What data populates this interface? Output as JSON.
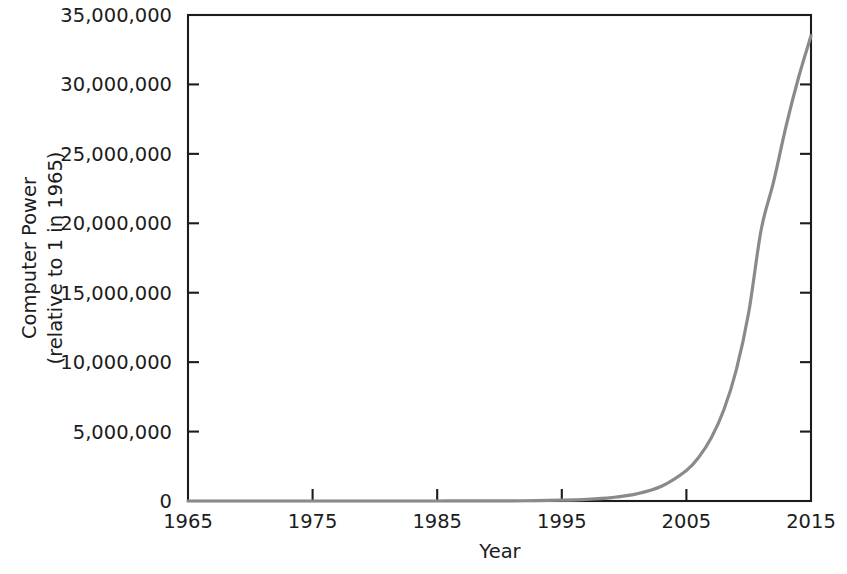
{
  "chart_data": {
    "type": "line",
    "title": "",
    "xlabel": "Year",
    "ylabel_line1": "Computer Power",
    "ylabel_line2": "(relative to 1 in 1965)",
    "xlim": [
      1965,
      2015
    ],
    "ylim": [
      0,
      35000000
    ],
    "grid": false,
    "legend": "none",
    "line_color": "#8a8a8a",
    "axis_color": "#1c1c1c",
    "background_color": "#ffffff",
    "x_ticks": [
      1965,
      1975,
      1985,
      1995,
      2005,
      2015
    ],
    "x_tick_labels": [
      "1965",
      "1975",
      "1985",
      "1995",
      "2005",
      "2015"
    ],
    "y_ticks": [
      0,
      5000000,
      10000000,
      15000000,
      20000000,
      25000000,
      30000000,
      35000000
    ],
    "y_tick_labels": [
      "0",
      "5,000,000",
      "10,000,000",
      "15,000,000",
      "20,000,000",
      "25,000,000",
      "30,000,000",
      "35,000,000"
    ],
    "series": [
      {
        "name": "Computer Power",
        "x": [
          1965,
          1967,
          1969,
          1971,
          1973,
          1975,
          1977,
          1979,
          1981,
          1983,
          1985,
          1987,
          1989,
          1991,
          1993,
          1995,
          1997,
          1999,
          2001,
          2003,
          2005,
          2006,
          2007,
          2008,
          2009,
          2010,
          2011,
          2012,
          2013,
          2014,
          2015
        ],
        "values": [
          1,
          2,
          4,
          9,
          19,
          39,
          81,
          168,
          348,
          722,
          1497,
          3104,
          6436,
          13343,
          27664,
          57352,
          118891,
          246471,
          510940,
          1059263,
          2196000,
          3161000,
          4550000,
          6550000,
          9428000,
          13571000,
          19534000,
          23000000,
          27000000,
          30500000,
          33500000
        ]
      }
    ]
  },
  "geometry": {
    "plot_left": 188,
    "plot_right": 811,
    "plot_top": 15,
    "plot_bottom": 501
  }
}
